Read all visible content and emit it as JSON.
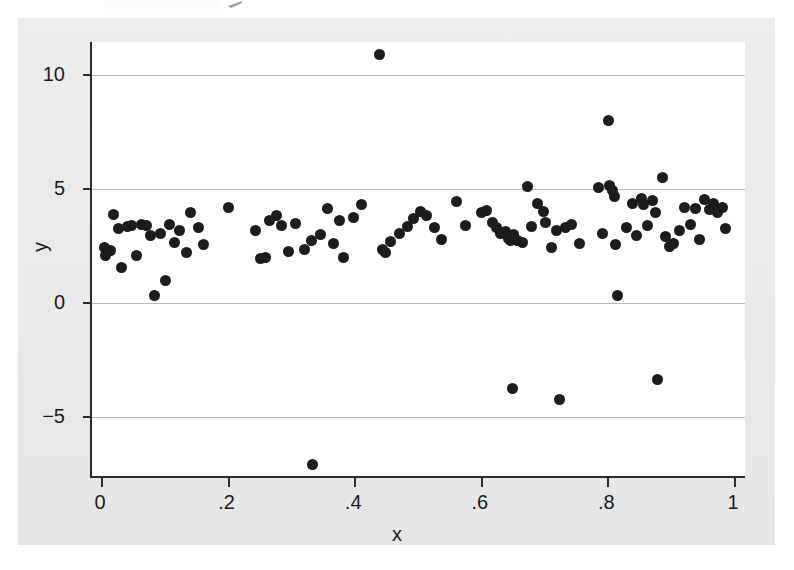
{
  "chart_data": {
    "type": "scatter",
    "title": "",
    "xlabel": "x",
    "ylabel": "y",
    "xlim": [
      0,
      1
    ],
    "ylim": [
      -8.4,
      12.3
    ],
    "grid": true,
    "legend": null,
    "marker": {
      "shape": "circle",
      "color": "#1c1c1c",
      "size": 11
    },
    "xticks": [
      0,
      0.2,
      0.4,
      0.6,
      0.8,
      1
    ],
    "xticklabels": [
      "0",
      ".2",
      ".4",
      ".6",
      ".8",
      "1"
    ],
    "yticks": [
      -5,
      0,
      5,
      10
    ],
    "yticklabels": [
      "−5",
      "0",
      "5",
      "10"
    ],
    "n_points": 110,
    "points": [
      {
        "x": 0.004,
        "y": 2.45
      },
      {
        "x": 0.006,
        "y": 2.1
      },
      {
        "x": 0.013,
        "y": 2.3
      },
      {
        "x": 0.018,
        "y": 3.9
      },
      {
        "x": 0.026,
        "y": 3.25
      },
      {
        "x": 0.031,
        "y": 1.55
      },
      {
        "x": 0.04,
        "y": 3.35
      },
      {
        "x": 0.047,
        "y": 3.4
      },
      {
        "x": 0.055,
        "y": 2.1
      },
      {
        "x": 0.063,
        "y": 3.45
      },
      {
        "x": 0.07,
        "y": 3.4
      },
      {
        "x": 0.077,
        "y": 2.95
      },
      {
        "x": 0.083,
        "y": 0.35
      },
      {
        "x": 0.093,
        "y": 3.05
      },
      {
        "x": 0.1,
        "y": 1.0
      },
      {
        "x": 0.107,
        "y": 3.45
      },
      {
        "x": 0.115,
        "y": 2.65
      },
      {
        "x": 0.122,
        "y": 3.2
      },
      {
        "x": 0.133,
        "y": 2.2
      },
      {
        "x": 0.14,
        "y": 3.95
      },
      {
        "x": 0.152,
        "y": 3.3
      },
      {
        "x": 0.161,
        "y": 2.55
      },
      {
        "x": 0.2,
        "y": 4.2
      },
      {
        "x": 0.243,
        "y": 3.2
      },
      {
        "x": 0.25,
        "y": 1.95
      },
      {
        "x": 0.258,
        "y": 2.0
      },
      {
        "x": 0.265,
        "y": 3.6
      },
      {
        "x": 0.276,
        "y": 3.85
      },
      {
        "x": 0.283,
        "y": 3.4
      },
      {
        "x": 0.295,
        "y": 2.25
      },
      {
        "x": 0.305,
        "y": 3.5
      },
      {
        "x": 0.32,
        "y": 2.35
      },
      {
        "x": 0.331,
        "y": 2.75
      },
      {
        "x": 0.333,
        "y": -7.1
      },
      {
        "x": 0.345,
        "y": 3.0
      },
      {
        "x": 0.356,
        "y": 4.15
      },
      {
        "x": 0.366,
        "y": 2.6
      },
      {
        "x": 0.375,
        "y": 3.6
      },
      {
        "x": 0.382,
        "y": 2.0
      },
      {
        "x": 0.398,
        "y": 3.75
      },
      {
        "x": 0.41,
        "y": 4.3
      },
      {
        "x": 0.438,
        "y": 10.9
      },
      {
        "x": 0.443,
        "y": 2.35
      },
      {
        "x": 0.448,
        "y": 2.2
      },
      {
        "x": 0.455,
        "y": 2.7
      },
      {
        "x": 0.47,
        "y": 3.05
      },
      {
        "x": 0.482,
        "y": 3.35
      },
      {
        "x": 0.492,
        "y": 3.7
      },
      {
        "x": 0.503,
        "y": 4.0
      },
      {
        "x": 0.512,
        "y": 3.85
      },
      {
        "x": 0.525,
        "y": 3.3
      },
      {
        "x": 0.536,
        "y": 2.8
      },
      {
        "x": 0.56,
        "y": 4.45
      },
      {
        "x": 0.575,
        "y": 3.4
      },
      {
        "x": 0.6,
        "y": 3.95
      },
      {
        "x": 0.608,
        "y": 4.05
      },
      {
        "x": 0.617,
        "y": 3.55
      },
      {
        "x": 0.623,
        "y": 3.3
      },
      {
        "x": 0.63,
        "y": 3.05
      },
      {
        "x": 0.637,
        "y": 3.15
      },
      {
        "x": 0.642,
        "y": 2.85
      },
      {
        "x": 0.646,
        "y": 2.75
      },
      {
        "x": 0.65,
        "y": 3.0
      },
      {
        "x": 0.648,
        "y": -3.75
      },
      {
        "x": 0.657,
        "y": 2.75
      },
      {
        "x": 0.665,
        "y": 2.65
      },
      {
        "x": 0.672,
        "y": 5.1
      },
      {
        "x": 0.678,
        "y": 3.35
      },
      {
        "x": 0.688,
        "y": 4.35
      },
      {
        "x": 0.697,
        "y": 4.0
      },
      {
        "x": 0.7,
        "y": 3.55
      },
      {
        "x": 0.71,
        "y": 2.45
      },
      {
        "x": 0.718,
        "y": 3.2
      },
      {
        "x": 0.722,
        "y": -4.25
      },
      {
        "x": 0.733,
        "y": 3.3
      },
      {
        "x": 0.742,
        "y": 3.45
      },
      {
        "x": 0.755,
        "y": 2.6
      },
      {
        "x": 0.784,
        "y": 5.05
      },
      {
        "x": 0.79,
        "y": 3.05
      },
      {
        "x": 0.8,
        "y": 8.0
      },
      {
        "x": 0.802,
        "y": 5.15
      },
      {
        "x": 0.806,
        "y": 4.95
      },
      {
        "x": 0.81,
        "y": 4.65
      },
      {
        "x": 0.812,
        "y": 2.55
      },
      {
        "x": 0.815,
        "y": 0.35
      },
      {
        "x": 0.828,
        "y": 3.3
      },
      {
        "x": 0.838,
        "y": 4.35
      },
      {
        "x": 0.845,
        "y": 2.95
      },
      {
        "x": 0.852,
        "y": 4.6
      },
      {
        "x": 0.856,
        "y": 4.3
      },
      {
        "x": 0.862,
        "y": 3.4
      },
      {
        "x": 0.87,
        "y": 4.5
      },
      {
        "x": 0.875,
        "y": 3.95
      },
      {
        "x": 0.878,
        "y": -3.35
      },
      {
        "x": 0.885,
        "y": 5.5
      },
      {
        "x": 0.89,
        "y": 2.9
      },
      {
        "x": 0.896,
        "y": 2.5
      },
      {
        "x": 0.903,
        "y": 2.6
      },
      {
        "x": 0.912,
        "y": 3.2
      },
      {
        "x": 0.92,
        "y": 4.2
      },
      {
        "x": 0.93,
        "y": 3.45
      },
      {
        "x": 0.938,
        "y": 4.15
      },
      {
        "x": 0.944,
        "y": 2.8
      },
      {
        "x": 0.952,
        "y": 4.55
      },
      {
        "x": 0.96,
        "y": 4.1
      },
      {
        "x": 0.966,
        "y": 4.35
      },
      {
        "x": 0.972,
        "y": 3.95
      },
      {
        "x": 0.98,
        "y": 4.2
      },
      {
        "x": 0.985,
        "y": 3.25
      }
    ]
  },
  "axes": {
    "y_title": "y",
    "x_title": "x",
    "y_labels": [
      "10",
      "5",
      "0",
      "−5"
    ],
    "x_labels": [
      "0",
      ".2",
      ".4",
      ".6",
      ".8",
      "1"
    ]
  },
  "colors": {
    "marker": "#1c1c1c",
    "gridline": "#b9b9b9",
    "axis": "#2b2b2b",
    "plot_background": "#ffffff",
    "graph_background": "#eaeaea"
  }
}
